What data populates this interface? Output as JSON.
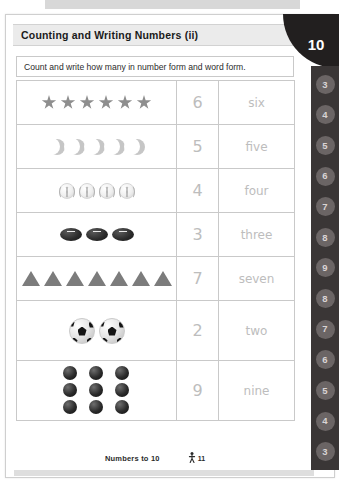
{
  "page": {
    "title": "Counting and Writing Numbers (ii)",
    "page_number": "10",
    "instruction": "Count and write how many in number form and word form.",
    "footer_label": "Numbers to 10",
    "footer_page_marker": "11",
    "footer_icon": "walking-person-icon"
  },
  "tab_strip": {
    "name": "chapter-tab-strip",
    "chips": [
      "3",
      "4",
      "5",
      "6",
      "7",
      "8",
      "9",
      "8",
      "7",
      "6",
      "5",
      "4",
      "3"
    ]
  },
  "colors": {
    "header_band": "#ebebeb",
    "badge_black": "#221f1f",
    "tab_strip_dark": "#3a3636",
    "tab_chip": "#6b6565",
    "answer_gray": "#bdbdbd",
    "border": "#c9c9c9"
  },
  "table": {
    "rows": [
      {
        "object_icon": "star-icon",
        "object_count": 6,
        "number_form": "6",
        "word_form": "six",
        "layout": "row",
        "tall": false
      },
      {
        "object_icon": "crescent-moon-icon",
        "object_count": 5,
        "number_form": "5",
        "word_form": "five",
        "layout": "row",
        "tall": false
      },
      {
        "object_icon": "baseball-icon",
        "object_count": 4,
        "number_form": "4",
        "word_form": "four",
        "layout": "row",
        "tall": false
      },
      {
        "object_icon": "football-icon",
        "object_count": 3,
        "number_form": "3",
        "word_form": "three",
        "layout": "row",
        "tall": false
      },
      {
        "object_icon": "triangle-icon",
        "object_count": 7,
        "number_form": "7",
        "word_form": "seven",
        "layout": "row",
        "tall": false
      },
      {
        "object_icon": "soccer-ball-icon",
        "object_count": 2,
        "number_form": "2",
        "word_form": "two",
        "layout": "row",
        "tall": true
      },
      {
        "object_icon": "bead-sphere-icon",
        "object_count": 9,
        "number_form": "9",
        "word_form": "nine",
        "layout": "grid-3x3",
        "tall": true
      }
    ]
  }
}
